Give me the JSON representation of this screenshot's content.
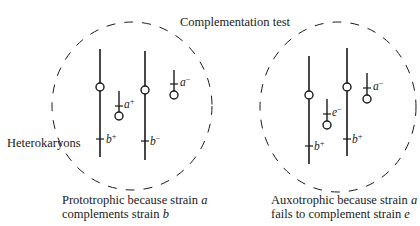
{
  "title": "Complementation test",
  "side_label": "Heterokaryons",
  "colors": {
    "ink": "#1a1a1a",
    "background": "#ffffff"
  },
  "panels": [
    {
      "id": "left",
      "caption_line1_prefix": "Prototrophic because strain ",
      "caption_line1_var": "a",
      "caption_line2_prefix": "complements strain ",
      "caption_line2_var": "b",
      "nuclei": [
        {
          "kind": "chromosome",
          "gene": "b",
          "allele": "+"
        },
        {
          "kind": "fragment",
          "gene": "a",
          "allele": "+"
        },
        {
          "kind": "chromosome",
          "gene": "b",
          "allele": "−"
        },
        {
          "kind": "fragment",
          "gene": "a",
          "allele": "−"
        }
      ]
    },
    {
      "id": "right",
      "caption_line1_prefix": "Auxotrophic because strain ",
      "caption_line1_var": "a",
      "caption_line2_prefix": "fails to complement strain ",
      "caption_line2_var": "e",
      "nuclei": [
        {
          "kind": "chromosome",
          "gene": "b",
          "allele": "+"
        },
        {
          "kind": "fragment",
          "gene": "e",
          "allele": "−"
        },
        {
          "kind": "chromosome",
          "gene": "b",
          "allele": "+"
        },
        {
          "kind": "fragment",
          "gene": "a",
          "allele": "−"
        }
      ]
    }
  ]
}
